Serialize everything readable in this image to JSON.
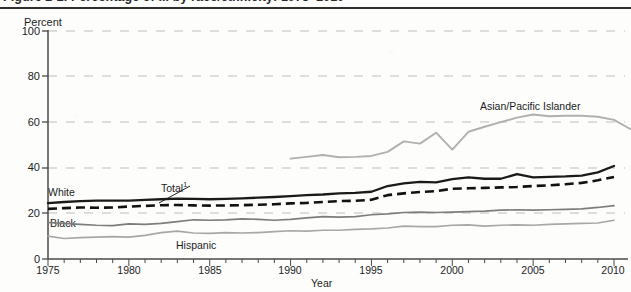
{
  "figure": {
    "title": "Figure 2-2.  Percentage of ... by race/ethnicity: 1975–2010",
    "footnote_marker": "1"
  },
  "axes": {
    "ylabel": "Percent",
    "xlabel": "Year",
    "yticks": [
      "0",
      "20",
      "40",
      "60",
      "80",
      "100"
    ],
    "xticks": [
      "1975",
      "1980",
      "1985",
      "1990",
      "1995",
      "2000",
      "2005",
      "2010"
    ]
  },
  "labels": {
    "total": "Total",
    "total_sup": "1",
    "white": "White",
    "black": "Black",
    "hispanic": "Hispanic",
    "asian": "Asian/Pacific Islander"
  },
  "colors": {
    "total": "#111111",
    "white": "#1a1a1a",
    "black_series": "#7d7d7d",
    "hispanic": "#a8a8a8",
    "asian": "#b0b0b0",
    "grid": "#bdbdbd",
    "axis": "#4a4a4a",
    "background": "#fdfdfc"
  },
  "chart_data": {
    "type": "line",
    "title": "Figure 2-2.  Percentage of ... by race/ethnicity: 1975–2010",
    "xlabel": "Year",
    "ylabel": "Percent",
    "xlim": [
      1975,
      2010
    ],
    "ylim": [
      0,
      100
    ],
    "yticks": [
      0,
      20,
      40,
      60,
      80,
      100
    ],
    "xticks": [
      1975,
      1980,
      1985,
      1990,
      1995,
      2000,
      2005,
      2010
    ],
    "grid": "horizontal-dashed",
    "legend": "inline-labels",
    "x": [
      1975,
      1976,
      1977,
      1978,
      1979,
      1980,
      1981,
      1982,
      1983,
      1984,
      1985,
      1986,
      1987,
      1988,
      1989,
      1990,
      1991,
      1992,
      1993,
      1994,
      1995,
      1996,
      1997,
      1998,
      1999,
      2000,
      2001,
      2002,
      2003,
      2004,
      2005,
      2006,
      2007,
      2008,
      2009,
      2010
    ],
    "series": [
      {
        "name": "Total",
        "style": "dashed",
        "color": "#111111",
        "values": [
          22.0,
          22.3,
          22.6,
          22.5,
          22.6,
          23.0,
          23.3,
          23.6,
          23.7,
          23.5,
          23.4,
          23.5,
          23.6,
          23.8,
          24.0,
          24.4,
          24.6,
          25.0,
          25.4,
          25.5,
          26.0,
          28.0,
          28.8,
          29.4,
          29.8,
          30.8,
          31.0,
          31.2,
          31.4,
          31.6,
          32.0,
          32.3,
          32.8,
          33.4,
          34.5,
          36.0
        ]
      },
      {
        "name": "White",
        "style": "solid",
        "color": "#1a1a1a",
        "values": [
          24.5,
          25.0,
          25.4,
          25.6,
          25.6,
          25.6,
          25.9,
          26.2,
          26.5,
          26.4,
          26.2,
          26.4,
          26.6,
          26.9,
          27.2,
          27.6,
          28.0,
          28.3,
          28.8,
          29.0,
          29.5,
          32.0,
          33.2,
          33.8,
          33.6,
          35.0,
          35.8,
          35.2,
          35.2,
          37.2,
          35.8,
          36.0,
          36.2,
          36.6,
          38.0,
          40.8
        ]
      },
      {
        "name": "Black",
        "style": "solid",
        "color": "#7d7d7d",
        "values": [
          16.0,
          15.6,
          15.2,
          14.8,
          14.6,
          15.4,
          15.2,
          15.6,
          16.4,
          17.2,
          17.0,
          17.2,
          17.6,
          17.4,
          17.0,
          17.4,
          18.0,
          18.6,
          18.4,
          18.6,
          19.4,
          19.8,
          20.4,
          20.6,
          20.4,
          20.6,
          20.8,
          21.0,
          21.4,
          21.6,
          21.4,
          21.6,
          21.8,
          22.0,
          22.6,
          23.4
        ]
      },
      {
        "name": "Hispanic",
        "style": "solid",
        "color": "#a8a8a8",
        "values": [
          10.0,
          9.0,
          9.4,
          9.6,
          9.8,
          9.6,
          10.4,
          11.6,
          12.2,
          11.4,
          11.2,
          11.6,
          11.4,
          11.6,
          12.0,
          12.4,
          12.2,
          12.6,
          12.6,
          13.0,
          13.2,
          13.6,
          14.4,
          14.2,
          14.2,
          14.8,
          15.0,
          14.4,
          14.8,
          15.0,
          14.8,
          15.2,
          15.4,
          15.6,
          15.8,
          17.0
        ]
      },
      {
        "name": "Asian/Pacific Islander",
        "style": "solid",
        "color": "#b0b0b0",
        "start_year": 1990,
        "values_from_1990": [
          44.0,
          44.8,
          45.6,
          44.6,
          44.8,
          45.2,
          47.0,
          51.6,
          50.6,
          55.4,
          48.0,
          55.8,
          58.0,
          60.0,
          62.0,
          63.4,
          62.6,
          62.8,
          62.8,
          62.4,
          61.0,
          57.0
        ]
      }
    ]
  }
}
